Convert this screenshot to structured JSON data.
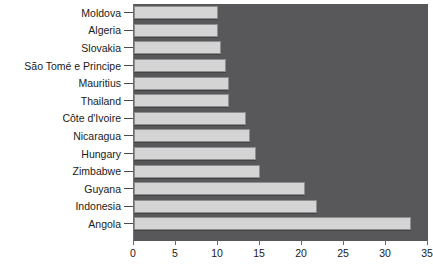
{
  "chart_data": {
    "type": "bar",
    "orientation": "horizontal",
    "title": "...as a % of the national income (1995)",
    "xlabel": "",
    "ylabel": "",
    "xlim": [
      0,
      35
    ],
    "xticks": [
      0,
      5,
      10,
      15,
      20,
      25,
      30,
      35
    ],
    "grid": false,
    "legend": "none",
    "categories": [
      "Moldova",
      "Algeria",
      "Slovakia",
      "São Tomé e Principe",
      "Mauritius",
      "Thailand",
      "Côte d'Ivoire",
      "Nicaragua",
      "Hungary",
      "Zimbabwe",
      "Guyana",
      "Indonesia",
      "Angola"
    ],
    "values": [
      10.0,
      10.0,
      10.3,
      10.9,
      11.3,
      11.3,
      13.3,
      13.8,
      14.5,
      15.0,
      20.4,
      21.8,
      33.0
    ],
    "colors": {
      "bar_fill": "#d4d4d4",
      "bar_border": "#8e8e90",
      "plot_background": "#58585a",
      "page_background": "#ffffff",
      "text": "#1a1a1a"
    }
  }
}
